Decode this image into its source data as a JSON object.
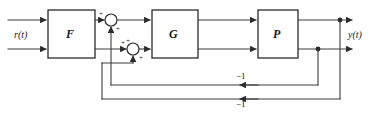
{
  "diagram": {
    "stroke_color": "#3d3d3d",
    "block_fill": "#ffffff",
    "block_stroke": "#2b2b2b",
    "text_color": "#1a1a1a",
    "blocks": [
      {
        "id": "F",
        "label": "F",
        "x": 48,
        "y": 10,
        "w": 47,
        "h": 48
      },
      {
        "id": "G",
        "label": "G",
        "x": 152,
        "y": 10,
        "w": 46,
        "h": 48
      },
      {
        "id": "P",
        "label": "P",
        "x": 258,
        "y": 10,
        "w": 40,
        "h": 48
      }
    ],
    "summing_junctions": [
      {
        "id": "sum-top",
        "cx": 111,
        "cy": 20,
        "r": 6
      },
      {
        "id": "sum-lower",
        "cx": 133,
        "cy": 49,
        "r": 6
      }
    ],
    "signals": {
      "input_label": "r(t)",
      "output_label": "y(t)"
    },
    "sign_marks": [
      {
        "id": "sum-top-plus-in",
        "text": "+",
        "x": 99,
        "y": 11
      },
      {
        "id": "sum-top-plus-fb",
        "text": "+",
        "x": 116,
        "y": 26
      },
      {
        "id": "sum-lower-plus-top",
        "text": "+",
        "x": 126,
        "y": 38
      },
      {
        "id": "sum-lower-plus-in",
        "text": "+",
        "x": 121,
        "y": 40
      },
      {
        "id": "sum-lower-plus-fb",
        "text": "+",
        "x": 139,
        "y": 55
      }
    ],
    "gains": [
      {
        "id": "inner-feedback-gain",
        "text": "−1",
        "x": 236,
        "y": 72
      },
      {
        "id": "outer-feedback-gain",
        "text": "−1",
        "x": 236,
        "y": 100
      }
    ]
  }
}
